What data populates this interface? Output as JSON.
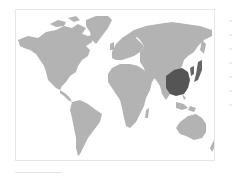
{
  "map": {
    "title": "World map",
    "projection": "equirectangular",
    "colors": {
      "background": "#ffffff",
      "land": "#b3b3b3",
      "highlight": "#555555",
      "frame_border": "#e6e6e6"
    },
    "highlighted_regions": [
      {
        "name": "China",
        "color": "#555555"
      },
      {
        "name": "Korea",
        "color": "#666666"
      },
      {
        "name": "Japan",
        "color": "#666666"
      }
    ],
    "regions": [
      "North America",
      "Greenland",
      "South America",
      "Europe",
      "Africa",
      "Asia",
      "Australia"
    ]
  },
  "side_legend": {
    "ticks": 7
  }
}
